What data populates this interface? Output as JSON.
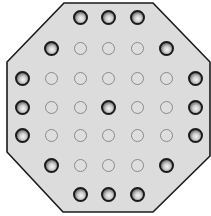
{
  "board": {
    "type": "peg-solitaire",
    "shape": "octagon",
    "colors": {
      "board_fill": "#dcdcdc",
      "board_outline": "#1a1a1a",
      "peg": "#1a1a1a",
      "hole": "#8a8a8a"
    },
    "octagon_points": "64,3 153,3 210,62 210,156 153,212 63,212 7,152 7,62",
    "grid": {
      "col_x": [
        22,
        51,
        80,
        108,
        137,
        166,
        195
      ],
      "row_y": [
        17,
        48,
        78,
        107,
        135,
        165,
        194
      ]
    },
    "rows": [
      [
        "none",
        "none",
        "peg",
        "peg",
        "peg",
        "none",
        "none"
      ],
      [
        "none",
        "peg",
        "hole",
        "hole",
        "hole",
        "peg",
        "none"
      ],
      [
        "peg",
        "hole",
        "hole",
        "hole",
        "hole",
        "hole",
        "peg"
      ],
      [
        "peg",
        "hole",
        "hole",
        "peg",
        "hole",
        "hole",
        "peg"
      ],
      [
        "peg",
        "hole",
        "hole",
        "hole",
        "hole",
        "hole",
        "peg"
      ],
      [
        "none",
        "peg",
        "hole",
        "hole",
        "hole",
        "peg",
        "none"
      ],
      [
        "none",
        "none",
        "peg",
        "peg",
        "peg",
        "none",
        "none"
      ]
    ],
    "peg_count": 17,
    "hole_count": 20
  }
}
